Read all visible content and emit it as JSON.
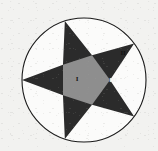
{
  "figure": {
    "background_color": "#f2f2f0",
    "canvas": {
      "width": 158,
      "height": 151
    }
  },
  "circle": {
    "name": "circumscribed-circle",
    "center_x": 84,
    "center_y": 80,
    "radius": 62,
    "stroke_color": "#1a1a1a",
    "stroke_width": 1.1,
    "fill_color": "#fbfbfa"
  },
  "star": {
    "name": "five-pointed-star",
    "points": 5,
    "outer_radius": 62,
    "inner_radius": 26,
    "rotation_degrees": -18,
    "point_fill_color": "#2b2b2b",
    "core_fill_color": "#8e8e8e"
  },
  "regions": [
    {
      "id": "region-1",
      "label": "I",
      "description": "central pentagon core of the star",
      "fill_color": "#8e8e8e",
      "label_color": "#141414",
      "label_x": 77,
      "label_y": 79
    },
    {
      "id": "region-2",
      "label": "II",
      "description": "white circular segment between star points, upper right",
      "fill_color": "#fbfbfa",
      "label_color": "#141414",
      "label_x": 123,
      "label_y": 53
    },
    {
      "id": "region-3",
      "label": "III",
      "description": "dark star point, right",
      "fill_color": "#2b2b2b",
      "label_color": "#f2f2f0",
      "label_x": 113,
      "label_y": 80
    }
  ],
  "legend": {
    "region_1_name": "I",
    "region_2_name": "II",
    "region_3_name": "III"
  }
}
